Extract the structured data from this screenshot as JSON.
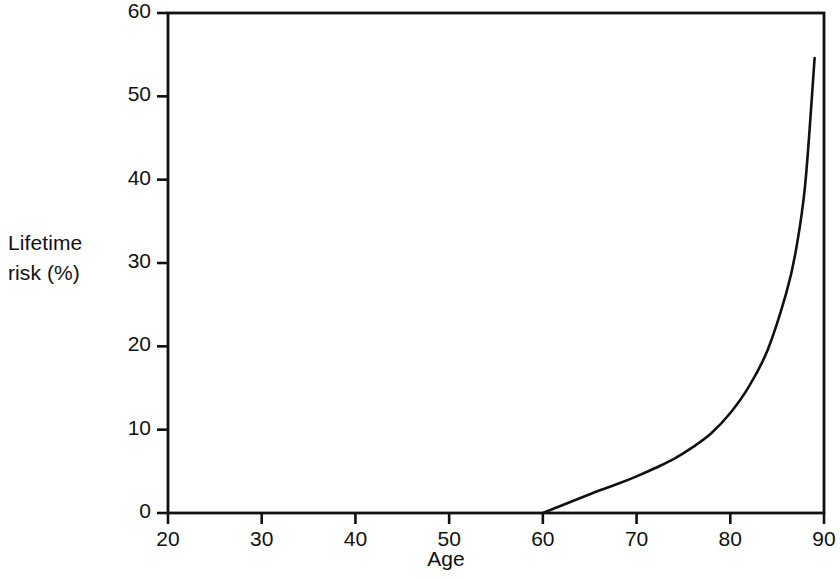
{
  "figure": {
    "background_color": "#ffffff",
    "ink_color": "#111111"
  },
  "chart_data": {
    "type": "line",
    "title": "",
    "subtitle": "",
    "xlabel": "Age",
    "ylabel": "Lifetime risk (%)",
    "ylabel_line1": "Lifetime",
    "ylabel_line2": "risk (%)",
    "xlim": [
      20,
      90
    ],
    "ylim": [
      0,
      60
    ],
    "xticks": [
      20,
      30,
      40,
      50,
      60,
      70,
      80,
      90
    ],
    "xtick_labels": [
      "20",
      "30",
      "40",
      "50",
      "60",
      "70",
      "80",
      "90"
    ],
    "yticks": [
      0,
      10,
      20,
      30,
      40,
      50,
      60
    ],
    "ytick_labels": [
      "0",
      "10",
      "20",
      "30",
      "40",
      "50",
      "60"
    ],
    "grid": false,
    "legend": null,
    "frame": "box",
    "series": [
      {
        "name": "Lifetime risk",
        "color": "#111111",
        "line_width": 2.6,
        "x": [
          60,
          62,
          64,
          66,
          68,
          70,
          72,
          74,
          76,
          78,
          80,
          82,
          84,
          86,
          87,
          88,
          89
        ],
        "values": [
          0.0,
          0.9,
          1.8,
          2.7,
          3.5,
          4.4,
          5.4,
          6.5,
          7.9,
          9.6,
          12.0,
          15.2,
          19.6,
          26.5,
          31.5,
          39.5,
          54.6
        ]
      }
    ],
    "annotations": []
  }
}
